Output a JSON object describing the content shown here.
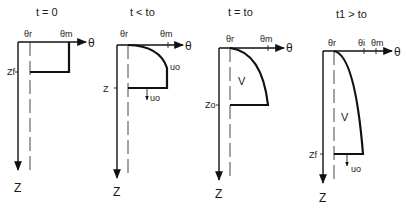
{
  "panels": [
    {
      "title": "t = 0",
      "theta_r": "θr",
      "theta_m": "θm",
      "theta_axis": "θ",
      "z_axis": "Z",
      "z_marker": "Zf"
    },
    {
      "title": "t < to",
      "theta_r": "θr",
      "theta_m": "θm",
      "theta_axis": "θ",
      "z_axis": "Z",
      "z_marker": "Z",
      "flux_top": "uo",
      "flux_bottom": "uo"
    },
    {
      "title": "t = to",
      "theta_r": "θr",
      "theta_m": "θm",
      "theta_axis": "θ",
      "z_axis": "Z",
      "z_marker": "Zo",
      "volume": "V"
    },
    {
      "title": "t1 > to",
      "theta_r": "θr",
      "theta_i": "θi",
      "theta_m": "θm",
      "theta_axis": "θ",
      "z_axis": "Z",
      "z_marker": "Zf",
      "volume": "V",
      "flux_bottom": "uo"
    }
  ]
}
